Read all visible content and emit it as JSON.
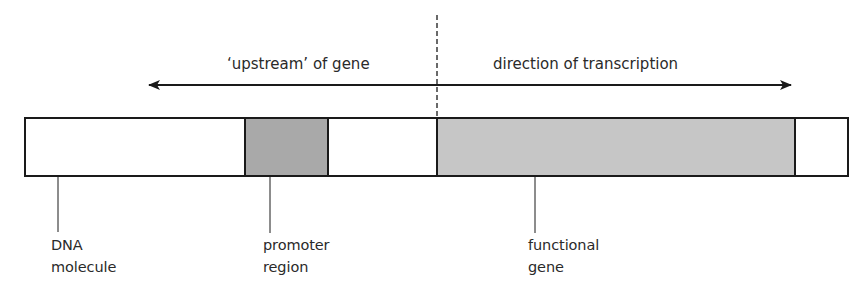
{
  "diagram": {
    "type": "gene structure schematic",
    "top_labels": {
      "upstream": "‘upstream’ of gene",
      "direction": "direction of transcription"
    },
    "segments": [
      {
        "id": "dna-left",
        "x1": 25,
        "x2": 245,
        "fill": "#ffffff"
      },
      {
        "id": "promoter",
        "x1": 245,
        "x2": 328,
        "fill": "#a9a9a9"
      },
      {
        "id": "spacer",
        "x1": 328,
        "x2": 437,
        "fill": "#ffffff"
      },
      {
        "id": "functional-gene",
        "x1": 437,
        "x2": 795,
        "fill": "#c6c6c6"
      },
      {
        "id": "dna-right",
        "x1": 795,
        "x2": 848,
        "fill": "#ffffff"
      }
    ],
    "labels": [
      {
        "id": "dna-molecule",
        "line1": "DNA",
        "line2": "molecule"
      },
      {
        "id": "promoter-region",
        "line1": "promoter",
        "line2": "region"
      },
      {
        "id": "functional-gene",
        "line1": "functional",
        "line2": "gene"
      }
    ],
    "colors": {
      "stroke": "#1a1a1a",
      "promoter_fill": "#a9a9a9",
      "gene_fill": "#c6c6c6"
    }
  }
}
